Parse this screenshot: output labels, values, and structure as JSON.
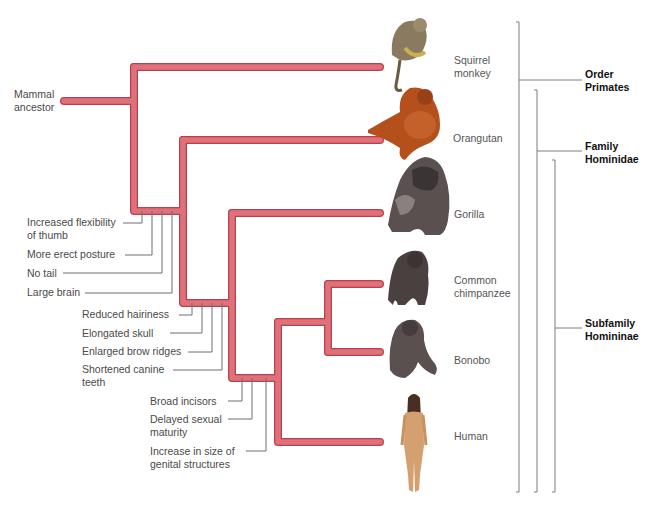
{
  "colors": {
    "branch_fill": "#e0707a",
    "branch_edge": "#b8414e",
    "trait_line": "#6b6f7a",
    "bracket_line": "#7a7a86",
    "label_text": "#4a4a4a",
    "taxon_text": "#111111"
  },
  "root": {
    "label": "Mammal ancestor",
    "lines": [
      "Mammal",
      "ancestor"
    ]
  },
  "species": [
    {
      "name": "Squirrel monkey",
      "lines": [
        "Squirrel",
        "monkey"
      ],
      "icon": "squirrel-monkey-illustration"
    },
    {
      "name": "Orangutan",
      "lines": [
        "Orangutan"
      ],
      "icon": "orangutan-illustration"
    },
    {
      "name": "Gorilla",
      "lines": [
        "Gorilla"
      ],
      "icon": "gorilla-illustration"
    },
    {
      "name": "Common chimpanzee",
      "lines": [
        "Common",
        "chimpanzee"
      ],
      "icon": "chimpanzee-illustration"
    },
    {
      "name": "Bonobo",
      "lines": [
        "Bonobo"
      ],
      "icon": "bonobo-illustration"
    },
    {
      "name": "Human",
      "lines": [
        "Human"
      ],
      "icon": "human-illustration"
    }
  ],
  "traits": {
    "hominidae_node": [
      {
        "lines": [
          "Increased flexibility",
          "of thumb"
        ]
      },
      {
        "lines": [
          "More erect posture"
        ]
      },
      {
        "lines": [
          "No tail"
        ]
      },
      {
        "lines": [
          "Large brain"
        ]
      }
    ],
    "hominin_node": [
      {
        "lines": [
          "Reduced hairiness"
        ]
      },
      {
        "lines": [
          "Elongated skull"
        ]
      },
      {
        "lines": [
          "Enlarged brow ridges"
        ]
      },
      {
        "lines": [
          "Shortened canine",
          "teeth"
        ]
      }
    ],
    "pan_human_node": [
      {
        "lines": [
          "Broad incisors"
        ]
      },
      {
        "lines": [
          "Delayed sexual",
          "maturity"
        ]
      },
      {
        "lines": [
          "Increase in size of",
          "genital structures"
        ]
      }
    ]
  },
  "taxa": [
    {
      "name": "Order Primates",
      "lines": [
        "Order",
        "Primates"
      ]
    },
    {
      "name": "Family Hominidae",
      "lines": [
        "Family",
        "Hominidae"
      ]
    },
    {
      "name": "Subfamily Homininae",
      "lines": [
        "Subfamily",
        "Homininae"
      ]
    }
  ]
}
